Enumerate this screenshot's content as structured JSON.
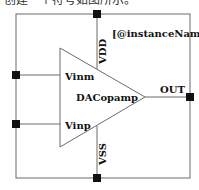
{
  "caption_cut": "创建一个符号如图所示。",
  "symbol": {
    "instance_label": "[@instanceName]",
    "cell_name": "DACopamp",
    "pins": {
      "top": "VDD",
      "bottom": "VSS",
      "left_upper": "Vinm",
      "left_lower": "Vinp",
      "right": "OUT"
    }
  },
  "colors": {
    "line": "#6b6b6b",
    "pin": "#111111",
    "text": "#111111"
  }
}
